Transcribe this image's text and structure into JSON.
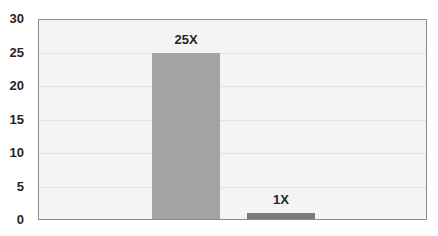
{
  "chart_data": {
    "type": "bar",
    "title": "",
    "xlabel": "",
    "ylabel": "",
    "categories": [
      "",
      ""
    ],
    "values": [
      25,
      1
    ],
    "data_labels": [
      "25X",
      "1X"
    ],
    "colors": [
      "#a3a3a3",
      "#7a7a7a"
    ],
    "ylim": [
      0,
      30
    ],
    "yticks": [
      0,
      5,
      10,
      15,
      20,
      25,
      30
    ],
    "grid": true,
    "legend": null
  },
  "colors": {
    "plot_background": "#f4f4f4",
    "gridline": "#e2e2e2",
    "axis_border": "#8c8c8c",
    "text": "#262626"
  }
}
